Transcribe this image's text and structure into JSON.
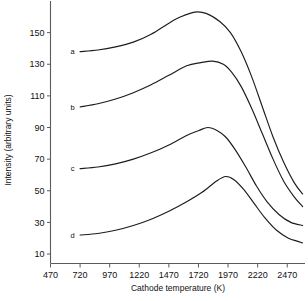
{
  "chart_data": {
    "type": "line",
    "title": "",
    "xlabel": "Cathode temperature (K)",
    "ylabel": "Intensity (arbitrary units)",
    "xlim": [
      470,
      2620
    ],
    "ylim": [
      4,
      170
    ],
    "xticks": [
      470,
      720,
      970,
      1220,
      1470,
      1720,
      1970,
      2220,
      2470
    ],
    "yticks": [
      10,
      30,
      50,
      70,
      90,
      110,
      130,
      150
    ],
    "xtick_labels": [
      "470",
      "720",
      "970",
      "1220",
      "1470",
      "1720",
      "1970",
      "2220",
      "2470"
    ],
    "ytick_labels": [
      "10",
      "30",
      "50",
      "70",
      "90",
      "110",
      "130",
      "150"
    ],
    "grid": false,
    "legend_position": "inline-curve-labels",
    "series": [
      {
        "name": "a",
        "label": "a",
        "peak_x": 1690,
        "peak_y": 163,
        "x": [
          720,
          870,
          1020,
          1170,
          1320,
          1470,
          1570,
          1690,
          1790,
          1900,
          1990,
          2080,
          2170,
          2260,
          2350,
          2440,
          2530,
          2600
        ],
        "y": [
          138,
          139,
          141,
          144,
          149,
          156,
          160,
          163,
          162,
          157,
          150,
          138,
          122,
          103,
          84,
          68,
          55,
          48
        ]
      },
      {
        "name": "b",
        "label": "b",
        "peak_x": 1840,
        "peak_y": 132,
        "x": [
          720,
          870,
          1020,
          1170,
          1320,
          1470,
          1620,
          1740,
          1840,
          1930,
          2000,
          2080,
          2170,
          2260,
          2350,
          2440,
          2530,
          2600
        ],
        "y": [
          103,
          105,
          108,
          112,
          117,
          123,
          129,
          131,
          132,
          130,
          125,
          116,
          102,
          86,
          70,
          56,
          46,
          40
        ]
      },
      {
        "name": "c",
        "label": "c",
        "peak_x": 1800,
        "peak_y": 90,
        "x": [
          720,
          870,
          1020,
          1170,
          1320,
          1470,
          1620,
          1720,
          1800,
          1880,
          1950,
          2030,
          2120,
          2210,
          2300,
          2400,
          2500,
          2600
        ],
        "y": [
          64,
          65,
          67,
          70,
          74,
          79,
          85,
          88,
          90,
          88,
          84,
          76,
          65,
          53,
          43,
          35,
          30,
          28
        ]
      },
      {
        "name": "d",
        "label": "d",
        "peak_x": 1950,
        "peak_y": 59,
        "x": [
          720,
          870,
          1020,
          1170,
          1320,
          1470,
          1620,
          1750,
          1870,
          1950,
          2020,
          2100,
          2190,
          2280,
          2380,
          2480,
          2560,
          2600
        ],
        "y": [
          22,
          23,
          25,
          28,
          32,
          37,
          43,
          49,
          56,
          59,
          57,
          51,
          42,
          33,
          25,
          20,
          18,
          17
        ]
      }
    ]
  },
  "axes": {
    "x_title": "Cathode temperature (K)",
    "y_title": "Intensity (arbitrary units)"
  }
}
